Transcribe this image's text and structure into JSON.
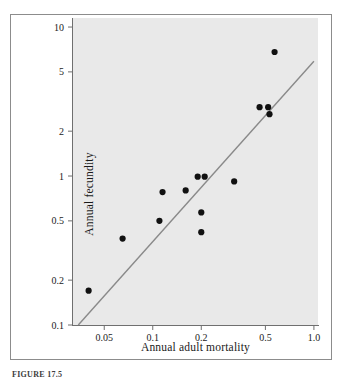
{
  "figure": {
    "caption": "FIGURE 17.5",
    "panel_bg": "#e9e9e9",
    "frame_color": "#8c8c8c",
    "point_color": "#111111",
    "line_color": "#8a8a8a"
  },
  "chart_data": {
    "type": "scatter",
    "title": "",
    "xlabel": "Annual adult mortality",
    "ylabel": "Annual fecundity",
    "xscale": "log",
    "yscale": "log",
    "xlim": [
      0.032,
      1.06
    ],
    "ylim": [
      0.1,
      11.5
    ],
    "grid": false,
    "legend": null,
    "xticks": [
      0.05,
      0.1,
      0.2,
      0.5,
      1.0
    ],
    "xticklabels": [
      "0.05",
      "0.1",
      "0.2",
      "0.5",
      "1.0"
    ],
    "yticks": [
      0.1,
      0.2,
      0.5,
      1,
      2,
      5,
      10
    ],
    "yticklabels": [
      "0.1",
      "0.2",
      "0.5",
      "1",
      "2",
      "5",
      "10"
    ],
    "x": [
      0.04,
      0.065,
      0.11,
      0.115,
      0.16,
      0.19,
      0.2,
      0.2,
      0.21,
      0.32,
      0.46,
      0.52,
      0.53,
      0.57
    ],
    "y": [
      0.17,
      0.38,
      0.5,
      0.78,
      0.8,
      0.99,
      0.42,
      0.57,
      0.99,
      0.92,
      2.9,
      2.9,
      2.6,
      6.8
    ],
    "series_name": "species",
    "trendline": {
      "type": "regression-line",
      "x0": 0.0345,
      "y0": 0.1,
      "x1": 1.0,
      "y1": 5.9
    }
  }
}
